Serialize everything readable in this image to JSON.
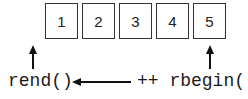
{
  "diagram": {
    "elements": [
      {
        "label": "1"
      },
      {
        "label": "2"
      },
      {
        "label": "3"
      },
      {
        "label": "4"
      },
      {
        "label": "5"
      }
    ],
    "rend_label": "rend()",
    "rbegin_label": "++ rbegin()",
    "colors": {
      "stroke": "#333333",
      "text": "#1a1a1a"
    }
  }
}
